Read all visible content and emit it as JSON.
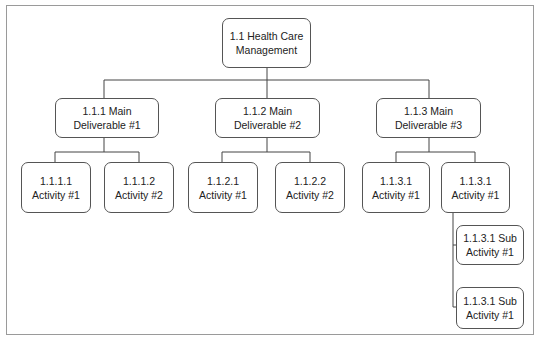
{
  "diagram": {
    "type": "work-breakdown-structure",
    "root": {
      "line1": "1.1 Health Care",
      "line2": "Management"
    },
    "deliverables": [
      {
        "line1": "1.1.1 Main",
        "line2": "Deliverable #1",
        "activities": [
          {
            "line1": "1.1.1.1",
            "line2": "Activity #1"
          },
          {
            "line1": "1.1.1.2",
            "line2": "Activity #2"
          }
        ]
      },
      {
        "line1": "1.1.2 Main",
        "line2": "Deliverable #2",
        "activities": [
          {
            "line1": "1.1.2.1",
            "line2": "Activity #1"
          },
          {
            "line1": "1.1.2.2",
            "line2": "Activity #2"
          }
        ]
      },
      {
        "line1": "1.1.3 Main",
        "line2": "Deliverable #3",
        "activities": [
          {
            "line1": "1.1.3.1",
            "line2": "Activity #1"
          },
          {
            "line1": "1.1.3.1",
            "line2": "Activity #1",
            "sub_activities": [
              {
                "line1": "1.1.3.1 Sub",
                "line2": "Activity #1"
              },
              {
                "line1": "1.1.3.1 Sub",
                "line2": "Activity #1"
              }
            ]
          }
        ]
      }
    ],
    "colors": {
      "border": "#555555",
      "frame": "#9a9a9a",
      "line": "#444444",
      "background": "#ffffff"
    }
  }
}
